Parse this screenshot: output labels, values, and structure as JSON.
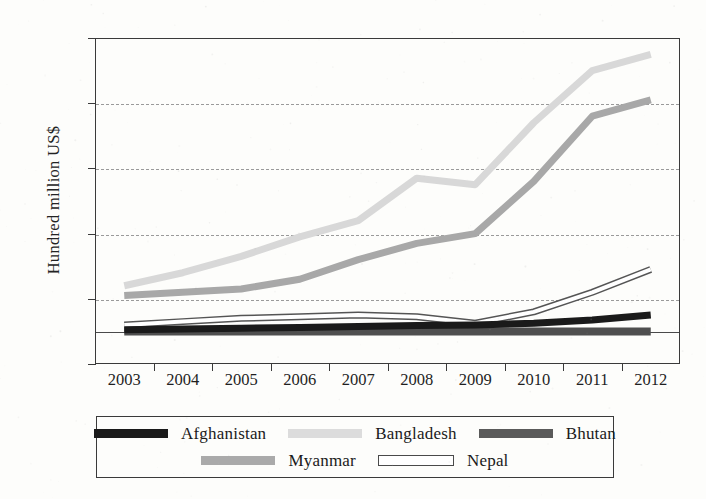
{
  "chart_data": {
    "type": "line",
    "title": "",
    "xlabel": "",
    "ylabel": "Hundred million US$",
    "categories": [
      "2003",
      "2004",
      "2005",
      "2006",
      "2007",
      "2008",
      "2009",
      "2010",
      "2011",
      "2012"
    ],
    "x": [
      2003,
      2004,
      2005,
      2006,
      2007,
      2008,
      2009,
      2010,
      2011,
      2012
    ],
    "ylim": [
      -10,
      90
    ],
    "yticks": [
      -10,
      10,
      30,
      50,
      70,
      90
    ],
    "ytick_labels": [
      "-10",
      "10",
      "30",
      "50",
      "70",
      "90"
    ],
    "grid": "horizontal-dashed",
    "legend_position": "bottom",
    "series": [
      {
        "name": "Afghanistan",
        "color": "#1a1a1a",
        "swatch": "solid-black",
        "values": [
          0.5,
          0.7,
          1.0,
          1.2,
          1.5,
          1.8,
          2.0,
          2.5,
          3.5,
          5.0
        ]
      },
      {
        "name": "Bangladesh",
        "color": "#d8d8d8",
        "swatch": "solid-light-gray",
        "values": [
          14,
          18,
          23,
          29,
          34,
          47,
          45,
          64,
          80,
          85
        ]
      },
      {
        "name": "Bhutan",
        "color": "#4f4f4f",
        "swatch": "solid-dark-gray",
        "values": [
          0,
          0,
          0,
          0,
          0,
          0,
          0,
          0,
          0,
          0
        ]
      },
      {
        "name": "Myanmar",
        "color": "#a8a8a8",
        "swatch": "solid-medium-gray",
        "values": [
          11,
          12,
          13,
          16,
          22,
          27,
          30,
          46,
          66,
          71
        ]
      },
      {
        "name": "Nepal",
        "color": "#ffffff",
        "swatch": "outlined-white",
        "values": [
          2,
          3,
          4,
          4.5,
          5,
          4.5,
          2.5,
          6,
          12,
          19
        ]
      }
    ]
  },
  "axes": {
    "y_title": "Hundred million US$",
    "y_tick_labels": [
      "90",
      "70",
      "50",
      "30",
      "10",
      "-10"
    ],
    "x_tick_labels": [
      "2003",
      "2004",
      "2005",
      "2006",
      "2007",
      "2008",
      "2009",
      "2010",
      "2011",
      "2012"
    ]
  },
  "legend": {
    "row1": [
      {
        "label": "Afghanistan",
        "swatch_color": "#1a1a1a",
        "outlined": false
      },
      {
        "label": "Bangladesh",
        "swatch_color": "#dcdcdc",
        "outlined": false
      },
      {
        "label": "Bhutan",
        "swatch_color": "#5a5a5a",
        "outlined": false
      }
    ],
    "row2": [
      {
        "label": "Myanmar",
        "swatch_color": "#aaaaaa",
        "outlined": false
      },
      {
        "label": "Nepal",
        "swatch_color": "#ffffff",
        "outlined": true
      }
    ]
  },
  "colors": {
    "background": "#fdfdfb",
    "axis": "#3a3a3a",
    "grid": "#9a9a9a",
    "text": "#1c1c1c"
  }
}
